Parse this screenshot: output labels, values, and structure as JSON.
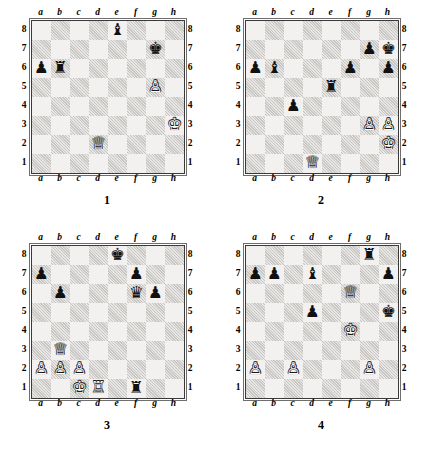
{
  "page": {
    "kind": "chess-diagram-sheet",
    "diagram_count": 4,
    "colors": {
      "light_square": "#f2f1ef",
      "dark_square": "#c9c7c4",
      "border": "#3a3a3a",
      "black_piece": "#111111",
      "white_piece": "#ffffff",
      "background": "#ffffff"
    }
  },
  "coordinates": {
    "files": [
      "a",
      "b",
      "c",
      "d",
      "e",
      "f",
      "g",
      "h"
    ],
    "ranks": [
      "8",
      "7",
      "6",
      "5",
      "4",
      "3",
      "2",
      "1"
    ]
  },
  "glyphs": {
    "white_king": "♔",
    "white_queen": "♕",
    "white_rook": "♖",
    "white_bishop": "♗",
    "white_knight": "♘",
    "white_pawn": "♙",
    "black_king": "♚",
    "black_queen": "♛",
    "black_rook": "♜",
    "black_bishop": "♝",
    "black_knight": "♞",
    "black_pawn": "♟"
  },
  "diagrams": [
    {
      "number": "1",
      "label": "1",
      "pieces": [
        {
          "square": "e8",
          "color": "black",
          "type": "bishop",
          "glyph": "♝"
        },
        {
          "square": "g7",
          "color": "black",
          "type": "king",
          "glyph": "♚"
        },
        {
          "square": "a6",
          "color": "black",
          "type": "pawn",
          "glyph": "♟"
        },
        {
          "square": "b6",
          "color": "black",
          "type": "rook",
          "glyph": "♜"
        },
        {
          "square": "g5",
          "color": "white",
          "type": "pawn",
          "glyph": "♙"
        },
        {
          "square": "h3",
          "color": "white",
          "type": "king",
          "glyph": "♔"
        },
        {
          "square": "d2",
          "color": "white",
          "type": "queen",
          "glyph": "♕"
        }
      ]
    },
    {
      "number": "2",
      "label": "2",
      "pieces": [
        {
          "square": "g7",
          "color": "black",
          "type": "pawn",
          "glyph": "♟"
        },
        {
          "square": "h7",
          "color": "black",
          "type": "king",
          "glyph": "♚"
        },
        {
          "square": "a6",
          "color": "black",
          "type": "pawn",
          "glyph": "♟"
        },
        {
          "square": "b6",
          "color": "black",
          "type": "bishop",
          "glyph": "♝"
        },
        {
          "square": "f6",
          "color": "black",
          "type": "pawn",
          "glyph": "♟"
        },
        {
          "square": "h6",
          "color": "black",
          "type": "pawn",
          "glyph": "♟"
        },
        {
          "square": "e5",
          "color": "black",
          "type": "rook",
          "glyph": "♜"
        },
        {
          "square": "c4",
          "color": "black",
          "type": "pawn",
          "glyph": "♟"
        },
        {
          "square": "g3",
          "color": "white",
          "type": "pawn",
          "glyph": "♙"
        },
        {
          "square": "h3",
          "color": "white",
          "type": "pawn",
          "glyph": "♙"
        },
        {
          "square": "h2",
          "color": "white",
          "type": "king",
          "glyph": "♔"
        },
        {
          "square": "d1",
          "color": "white",
          "type": "queen",
          "glyph": "♕"
        }
      ]
    },
    {
      "number": "3",
      "label": "3",
      "pieces": [
        {
          "square": "e8",
          "color": "black",
          "type": "king",
          "glyph": "♚"
        },
        {
          "square": "a7",
          "color": "black",
          "type": "pawn",
          "glyph": "♟"
        },
        {
          "square": "f7",
          "color": "black",
          "type": "pawn",
          "glyph": "♟"
        },
        {
          "square": "b6",
          "color": "black",
          "type": "pawn",
          "glyph": "♟"
        },
        {
          "square": "f6",
          "color": "black",
          "type": "queen",
          "glyph": "♛"
        },
        {
          "square": "g6",
          "color": "black",
          "type": "pawn",
          "glyph": "♟"
        },
        {
          "square": "b3",
          "color": "white",
          "type": "queen",
          "glyph": "♕"
        },
        {
          "square": "a2",
          "color": "white",
          "type": "pawn",
          "glyph": "♙"
        },
        {
          "square": "b2",
          "color": "white",
          "type": "pawn",
          "glyph": "♙"
        },
        {
          "square": "c2",
          "color": "white",
          "type": "pawn",
          "glyph": "♙"
        },
        {
          "square": "c1",
          "color": "white",
          "type": "king",
          "glyph": "♔"
        },
        {
          "square": "d1",
          "color": "white",
          "type": "rook",
          "glyph": "♖"
        },
        {
          "square": "f1",
          "color": "black",
          "type": "rook",
          "glyph": "♜"
        }
      ]
    },
    {
      "number": "4",
      "label": "4",
      "pieces": [
        {
          "square": "g8",
          "color": "black",
          "type": "rook",
          "glyph": "♜"
        },
        {
          "square": "a7",
          "color": "black",
          "type": "pawn",
          "glyph": "♟"
        },
        {
          "square": "b7",
          "color": "black",
          "type": "pawn",
          "glyph": "♟"
        },
        {
          "square": "d7",
          "color": "black",
          "type": "bishop",
          "glyph": "♝"
        },
        {
          "square": "h7",
          "color": "black",
          "type": "pawn",
          "glyph": "♟"
        },
        {
          "square": "f6",
          "color": "white",
          "type": "queen",
          "glyph": "♕"
        },
        {
          "square": "d5",
          "color": "black",
          "type": "pawn",
          "glyph": "♟"
        },
        {
          "square": "h5",
          "color": "black",
          "type": "king",
          "glyph": "♚"
        },
        {
          "square": "f4",
          "color": "white",
          "type": "king",
          "glyph": "♔"
        },
        {
          "square": "a2",
          "color": "white",
          "type": "pawn",
          "glyph": "♙"
        },
        {
          "square": "c2",
          "color": "white",
          "type": "pawn",
          "glyph": "♙"
        },
        {
          "square": "g2",
          "color": "white",
          "type": "pawn",
          "glyph": "♙"
        }
      ]
    }
  ]
}
